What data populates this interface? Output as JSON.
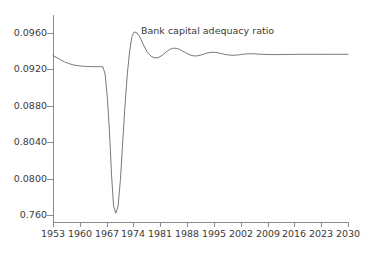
{
  "chart_data": {
    "type": "line",
    "title": "",
    "annotations": [
      {
        "text": "Bank capital adequacy ratio",
        "x_year": 1976,
        "y_value": 0.0968
      }
    ],
    "xlabel": "",
    "ylabel": "",
    "xlim": [
      1953,
      2030
    ],
    "ylim": [
      0.076,
      0.098
    ],
    "grid": false,
    "legend": false,
    "x_tick_labels": [
      "1953",
      "1960",
      "1967",
      "1974",
      "1981",
      "1988",
      "1995",
      "2002",
      "2009",
      "2016",
      "2023",
      "2030"
    ],
    "x_tick_values": [
      1953,
      1960,
      1967,
      1974,
      1981,
      1988,
      1995,
      2002,
      2009,
      2016,
      2023,
      2030
    ],
    "y_tick_labels": [
      "0.0960",
      "0.0920",
      "0.0880",
      "0.8040",
      "0.0800",
      "0.760"
    ],
    "y_tick_values": [
      0.096,
      0.092,
      0.088,
      0.084,
      0.08,
      0.076
    ],
    "series": [
      {
        "name": "Bank capital adequacy ratio",
        "color": "#6a6a6a",
        "x": [
          1953,
          1954,
          1955,
          1956,
          1957,
          1958,
          1959,
          1960,
          1961,
          1962,
          1963,
          1964,
          1965,
          1966,
          1966.6,
          1967.2,
          1967.8,
          1968.3,
          1968.8,
          1969.4,
          1970,
          1970.6,
          1971.2,
          1971.8,
          1972.4,
          1973,
          1973.6,
          1974.2,
          1975,
          1975.8,
          1976.6,
          1977.5,
          1978.5,
          1979.5,
          1980.5,
          1981.5,
          1982.5,
          1983.5,
          1984.5,
          1985.5,
          1986.5,
          1987.5,
          1988.5,
          1989.5,
          1990.5,
          1991.5,
          1992.5,
          1993.5,
          1994.5,
          1995.5,
          1996.5,
          1997.5,
          1998.5,
          1999.5,
          2000.5,
          2001.5,
          2002.5,
          2003.5,
          2004.5,
          2005.5,
          2006.5,
          2008,
          2010,
          2012,
          2014,
          2016,
          2018,
          2020,
          2022,
          2024,
          2026,
          2028,
          2030
        ],
        "y": [
          0.09352,
          0.0933,
          0.09305,
          0.09283,
          0.09266,
          0.09253,
          0.09244,
          0.09238,
          0.09234,
          0.09232,
          0.09231,
          0.0923,
          0.0923,
          0.09229,
          0.0915,
          0.0888,
          0.0847,
          0.0803,
          0.077,
          0.0762,
          0.077,
          0.0799,
          0.084,
          0.0881,
          0.0915,
          0.094,
          0.0956,
          0.09612,
          0.096,
          0.09545,
          0.0947,
          0.09398,
          0.09348,
          0.09326,
          0.0933,
          0.09355,
          0.0939,
          0.0942,
          0.09434,
          0.0943,
          0.0941,
          0.09385,
          0.09363,
          0.0935,
          0.09348,
          0.09356,
          0.0937,
          0.09383,
          0.09388,
          0.09386,
          0.09378,
          0.09368,
          0.0936,
          0.09356,
          0.09356,
          0.0936,
          0.09366,
          0.0937,
          0.09372,
          0.09371,
          0.09368,
          0.09365,
          0.09363,
          0.09363,
          0.09364,
          0.09365,
          0.09366,
          0.09366,
          0.09366,
          0.09366,
          0.09366,
          0.09366,
          0.09366
        ]
      }
    ]
  },
  "axis_color": "#8c8c8c",
  "text_color": "#3a3a3a"
}
